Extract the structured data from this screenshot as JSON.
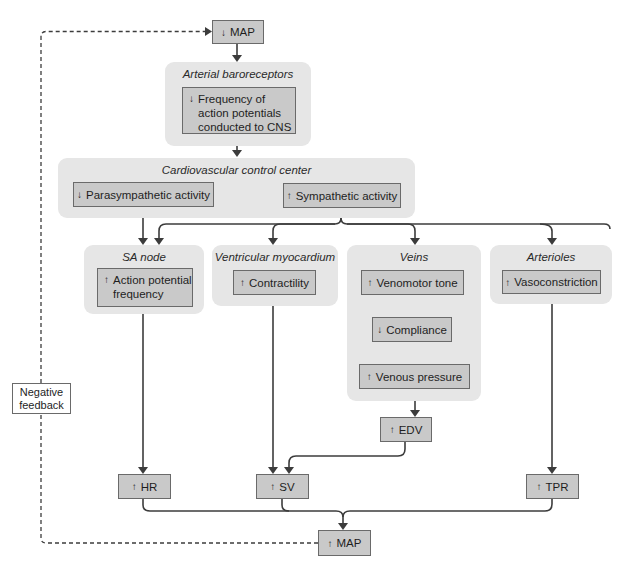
{
  "diagram": {
    "type": "flowchart",
    "topic": "Baroreceptor reflex response to decreased mean arterial pressure"
  },
  "nodes": {
    "map_top": {
      "arrow": "down",
      "label": "MAP"
    },
    "baroreceptors": {
      "title": "Arterial baroreceptors",
      "box": {
        "arrow": "down",
        "label": "Frequency of\naction potentials\nconducted to CNS"
      }
    },
    "control_center": {
      "title": "Cardiovascular control center",
      "parasympathetic": {
        "arrow": "down",
        "label": "Parasympathetic activity"
      },
      "sympathetic": {
        "arrow": "up",
        "label": "Sympathetic activity"
      }
    },
    "sa_node": {
      "title": "SA node",
      "box": {
        "arrow": "up",
        "label": "Action potential\nfrequency"
      }
    },
    "ventricular": {
      "title": "Ventricular myocardium",
      "box": {
        "arrow": "up",
        "label": "Contractility"
      }
    },
    "veins": {
      "title": "Veins",
      "venomotor": {
        "arrow": "up",
        "label": "Venomotor tone"
      },
      "compliance": {
        "arrow": "down",
        "label": "Compliance"
      },
      "venous_pressure": {
        "arrow": "up",
        "label": "Venous pressure"
      }
    },
    "arterioles": {
      "title": "Arterioles",
      "box": {
        "arrow": "up",
        "label": "Vasoconstriction"
      }
    },
    "edv": {
      "arrow": "up",
      "label": "EDV"
    },
    "hr": {
      "arrow": "up",
      "label": "HR"
    },
    "sv": {
      "arrow": "up",
      "label": "SV"
    },
    "tpr": {
      "arrow": "up",
      "label": "TPR"
    },
    "map_bottom": {
      "arrow": "up",
      "label": "MAP"
    },
    "negative_feedback": {
      "label": "Negative\nfeedback"
    }
  },
  "glyphs": {
    "up": "↑",
    "down": "↓"
  },
  "colors": {
    "panel_bg": "#e6e6e6",
    "box_bg": "#c9c9c9",
    "box_border": "#6a6a6a",
    "line": "#3c3c3c"
  }
}
